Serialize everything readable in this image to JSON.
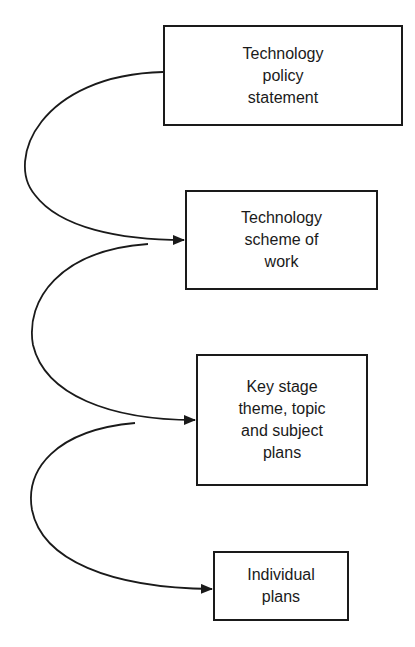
{
  "diagram": {
    "type": "flow",
    "nodes": [
      {
        "id": "policy",
        "label": "Technology\npolicy\nstatement"
      },
      {
        "id": "scheme",
        "label": "Technology\nscheme of\nwork"
      },
      {
        "id": "keystage",
        "label": "Key stage\ntheme, topic\nand subject\nplans"
      },
      {
        "id": "individual",
        "label": "Individual\nplans"
      }
    ],
    "edges": [
      {
        "from": "policy",
        "to": "scheme"
      },
      {
        "from": "scheme",
        "to": "keystage"
      },
      {
        "from": "keystage",
        "to": "individual"
      }
    ]
  }
}
